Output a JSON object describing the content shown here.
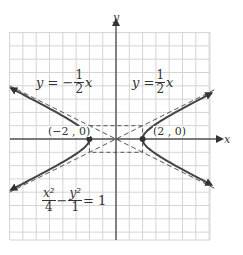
{
  "chart_data": {
    "type": "line",
    "title": "",
    "xlabel": "x",
    "ylabel": "y",
    "xlim": [
      -8,
      7
    ],
    "ylim": [
      -7.5,
      8
    ],
    "grid": true,
    "equation": {
      "text": "x^2/4 - y^2/1 = 1",
      "term1_num": "x²",
      "term1_den": "4",
      "minus": "−",
      "term2_num": "y²",
      "term2_den": "1",
      "rhs": "= 1"
    },
    "vertices": [
      {
        "x": -2,
        "y": 0,
        "label": "(−2 , 0)"
      },
      {
        "x": 2,
        "y": 0,
        "label": "(2 , 0)"
      }
    ],
    "asymptotes": [
      {
        "name": "y = -1/2 x",
        "slope": -0.5,
        "lhs": "y = −",
        "num": "1",
        "den": "2",
        "var": "x",
        "style": "dashed"
      },
      {
        "name": "y = 1/2 x",
        "slope": 0.5,
        "lhs": "y =",
        "num": "1",
        "den": "2",
        "var": "x",
        "style": "dashed"
      }
    ],
    "series": [
      {
        "name": "right branch",
        "a": 2,
        "b": 1,
        "branch": "right"
      },
      {
        "name": "left branch",
        "a": 2,
        "b": 1,
        "branch": "left"
      }
    ],
    "fundamental_rectangle": {
      "x": [
        -2,
        2
      ],
      "y": [
        -1,
        1
      ],
      "style": "dashed"
    }
  },
  "labels": {
    "x_axis": "x",
    "y_axis": "y",
    "vertex_left": "(−2 , 0)",
    "vertex_right": "(2 , 0)"
  },
  "colors": {
    "grid": "#d4d4d4",
    "axis": "#555555",
    "curve": "#444444",
    "asymptote": "#555555"
  }
}
